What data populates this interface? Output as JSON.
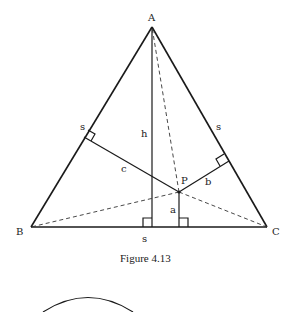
{
  "figure": {
    "caption": "Figure 4.13",
    "vertices": {
      "A": {
        "label": "A",
        "x": 152,
        "y": 27
      },
      "B": {
        "label": "B",
        "x": 31,
        "y": 227
      },
      "C": {
        "label": "C",
        "x": 267,
        "y": 227
      },
      "P": {
        "label": "P",
        "x": 179,
        "y": 192
      }
    },
    "segment_labels": {
      "side_ab": "s",
      "side_ac": "s",
      "side_bc": "s",
      "altitude": "h",
      "dist_a": "a",
      "dist_b": "b",
      "dist_c": "c"
    },
    "colors": {
      "line": "#1a1a1a",
      "background": "#ffffff"
    }
  }
}
